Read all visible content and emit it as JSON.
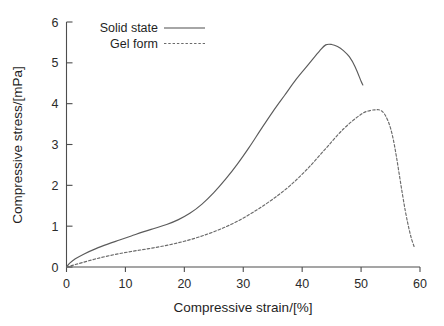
{
  "chart_data": {
    "type": "line",
    "title": "",
    "xlabel": "Compressive strain/[%]",
    "ylabel": "Compressive stress/[mPa]",
    "xlim": [
      0,
      60
    ],
    "ylim": [
      0,
      6
    ],
    "xticks": [
      0,
      10,
      20,
      30,
      40,
      50,
      60
    ],
    "yticks": [
      0,
      1,
      2,
      3,
      4,
      5,
      6
    ],
    "xtick_labels": [
      "0",
      "10",
      "20",
      "30",
      "40",
      "50",
      "60"
    ],
    "ytick_labels": [
      "0",
      "1",
      "2",
      "3",
      "4",
      "5",
      "6"
    ],
    "grid": false,
    "legend_position": "top-left-inside",
    "series": [
      {
        "name": "Solid state",
        "line_style": "solid",
        "color": "#5b5b5b",
        "x": [
          0,
          0.6,
          1.5,
          3,
          5,
          7,
          9,
          11,
          13,
          15,
          17,
          19,
          21,
          23,
          25,
          27,
          29,
          31,
          33,
          35,
          37,
          39,
          41,
          43,
          44,
          45,
          46,
          47,
          48,
          49,
          50,
          50.3
        ],
        "y": [
          0,
          0.1,
          0.2,
          0.32,
          0.45,
          0.56,
          0.66,
          0.76,
          0.86,
          0.95,
          1.04,
          1.16,
          1.32,
          1.54,
          1.82,
          2.15,
          2.52,
          2.93,
          3.37,
          3.8,
          4.2,
          4.6,
          4.95,
          5.3,
          5.44,
          5.45,
          5.4,
          5.3,
          5.15,
          4.9,
          4.55,
          4.46
        ]
      },
      {
        "name": "Gel form",
        "line_style": "dashed",
        "color": "#6a6a6a",
        "x": [
          0,
          1,
          2.5,
          5,
          8,
          11,
          14,
          17,
          20,
          23,
          26,
          29,
          32,
          35,
          38,
          41,
          44,
          47,
          50,
          51.5,
          52.5,
          53,
          53.5,
          54,
          54.5,
          55,
          55.5,
          56,
          56.5,
          57,
          57.5,
          58,
          58.5,
          59
        ],
        "y": [
          0,
          0.04,
          0.1,
          0.2,
          0.3,
          0.38,
          0.45,
          0.53,
          0.63,
          0.76,
          0.92,
          1.12,
          1.37,
          1.66,
          2.0,
          2.42,
          2.9,
          3.38,
          3.74,
          3.83,
          3.85,
          3.85,
          3.82,
          3.74,
          3.6,
          3.4,
          3.1,
          2.7,
          2.25,
          1.8,
          1.38,
          1.02,
          0.72,
          0.5
        ]
      }
    ],
    "annotations": []
  },
  "legend": {
    "entries": [
      {
        "label": "Solid state",
        "style": "solid"
      },
      {
        "label": "Gel form",
        "style": "dashed"
      }
    ]
  }
}
